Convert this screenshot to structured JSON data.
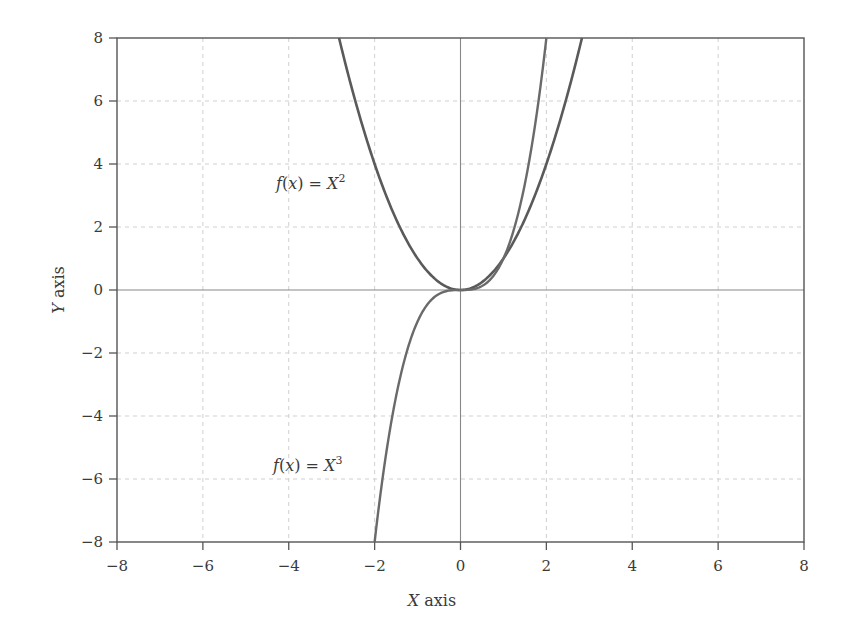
{
  "chart_data": {
    "type": "line",
    "title": "",
    "xlabel": "X axis",
    "ylabel": "Y axis",
    "xlim": [
      -8,
      8
    ],
    "ylim": [
      -8,
      8
    ],
    "grid": true,
    "legend": null,
    "x_ticks": [
      -8,
      -6,
      -4,
      -2,
      0,
      2,
      4,
      6,
      8
    ],
    "y_ticks": [
      -8,
      -6,
      -4,
      -2,
      0,
      2,
      4,
      6,
      8
    ],
    "x_tick_labels": [
      "−8",
      "−6",
      "−4",
      "−2",
      "0",
      "2",
      "4",
      "6",
      "8"
    ],
    "y_tick_labels": [
      "−8",
      "−6",
      "−4",
      "−2",
      "0",
      "2",
      "4",
      "6",
      "8"
    ],
    "series": [
      {
        "name": "f(x) = X^2",
        "function": "x^2",
        "color": "#5a5a5a",
        "x": [
          -2.83,
          -2,
          -1,
          0,
          1,
          2,
          2.83
        ],
        "y": [
          8,
          4,
          1,
          0,
          1,
          4,
          8
        ]
      },
      {
        "name": "f(x) = X^3",
        "function": "x^3",
        "color": "#6a6a6a",
        "x": [
          -2,
          -1,
          -0.5,
          0,
          0.5,
          1,
          2
        ],
        "y": [
          -8,
          -1,
          -0.125,
          0,
          0.125,
          1,
          8
        ]
      }
    ],
    "annotations": [
      {
        "text_prefix": "f(x) = X",
        "superscript": "2",
        "x": -4.2,
        "y": 3.3
      },
      {
        "text_prefix": "f(x) = X",
        "superscript": "3",
        "x": -4.4,
        "y": -5.5
      }
    ]
  },
  "labels": {
    "x_axis": "X axis",
    "y_axis": "Y axis",
    "annot_sq_prefix": "f(x) = X",
    "annot_sq_sup": "2",
    "annot_cube_prefix": "f(x) = X",
    "annot_cube_sup": "3"
  }
}
